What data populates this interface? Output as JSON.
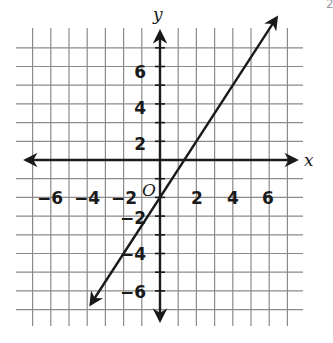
{
  "chart_data": {
    "type": "line",
    "title": "",
    "equation": "y = 1.5x - 2",
    "xlabel": "x",
    "ylabel": "y",
    "origin_label": "O",
    "xlim": [
      -7,
      7
    ],
    "ylim": [
      -9,
      8
    ],
    "grid": true,
    "x_tick_labels": [
      "-6",
      "-4",
      "-2",
      "2",
      "4",
      "6"
    ],
    "y_tick_labels": [
      "6",
      "4",
      "2",
      "-2",
      "-4",
      "-6"
    ],
    "series": [
      {
        "name": "line",
        "x": [
          -3.8,
          0,
          1.333,
          2,
          4,
          6.4
        ],
        "y": [
          -7.7,
          -2,
          0,
          1,
          4,
          7.6
        ],
        "arrows_both_ends": true
      }
    ],
    "legend": null
  },
  "labels": {
    "x_axis": "x",
    "y_axis": "y",
    "origin": "O",
    "corner_mark": "2",
    "xticks": [
      {
        "text": "−6",
        "x": 50,
        "y": 204
      },
      {
        "text": "−4",
        "x": 87,
        "y": 204
      },
      {
        "text": "−2",
        "x": 124,
        "y": 204
      },
      {
        "text": "2",
        "x": 197,
        "y": 204
      },
      {
        "text": "4",
        "x": 233,
        "y": 204
      },
      {
        "text": "6",
        "x": 268,
        "y": 204
      }
    ],
    "yticks": [
      {
        "text": "6",
        "x": 146,
        "y": 78
      },
      {
        "text": "4",
        "x": 146,
        "y": 114
      },
      {
        "text": "2",
        "x": 146,
        "y": 150
      },
      {
        "text": "−2",
        "x": 146,
        "y": 224
      },
      {
        "text": "−4",
        "x": 146,
        "y": 260
      },
      {
        "text": "−6",
        "x": 146,
        "y": 298
      }
    ]
  }
}
